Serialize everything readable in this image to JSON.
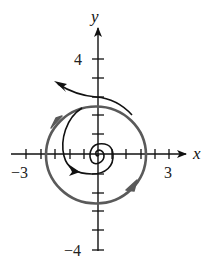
{
  "figure": {
    "type": "phase-portrait",
    "x_axis": {
      "label": "x",
      "tick_labels": [
        {
          "text": "−3",
          "value": -3
        },
        {
          "text": "3",
          "value": 3
        }
      ],
      "range": [
        -3.6,
        3.7
      ]
    },
    "y_axis": {
      "label": "y",
      "tick_labels": [
        {
          "text": "4",
          "value": 4
        },
        {
          "text": "−4",
          "value": -4
        }
      ],
      "range": [
        -4,
        5.3
      ]
    },
    "curves": [
      {
        "name": "limit-cycle",
        "description": "closed orbit, counterclockwise",
        "color": "#5a5a5a"
      },
      {
        "name": "outer-trajectory",
        "description": "spirals outward away from limit cycle, upper left",
        "color": "#111111"
      },
      {
        "name": "inner-trajectory",
        "description": "spirals inward toward origin",
        "color": "#111111"
      }
    ]
  }
}
